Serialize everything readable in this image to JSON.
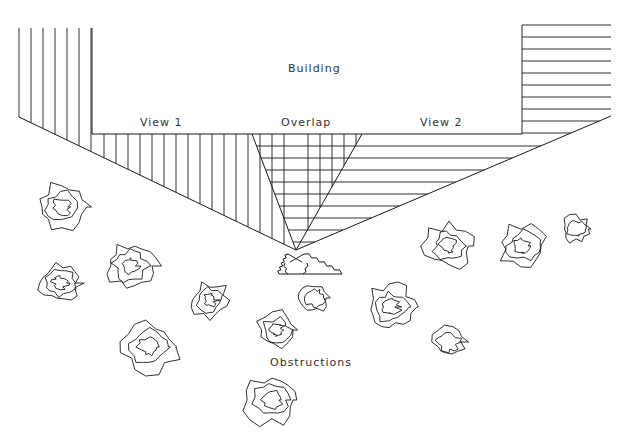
{
  "diagram": {
    "type": "camera-coverage-schematic",
    "labels": {
      "building": "Building",
      "view1": "View 1",
      "overlap": "Overlap",
      "view2": "View 2",
      "obstructions": "Obstructions"
    },
    "label_positions": {
      "building": {
        "x": 288,
        "y": 62
      },
      "view1": {
        "x": 140,
        "y": 116
      },
      "overlap": {
        "x": 281,
        "y": 116
      },
      "view2": {
        "x": 420,
        "y": 116
      },
      "obstructions": {
        "x": 270,
        "y": 356
      }
    },
    "colors": {
      "line": "#1a1a1a",
      "text": "#333333",
      "background": "#ffffff"
    },
    "geometry": {
      "camera_point": {
        "x": 296,
        "y": 250
      },
      "building_base_y": 134,
      "building_base_x1": 92,
      "building_base_x2": 522,
      "left_wall": {
        "x1": 19,
        "x2": 92,
        "top": 28,
        "slant_y_at_x1": 117
      },
      "right_wall": {
        "x1": 522,
        "x2": 611,
        "top": 25,
        "slant_y_at_x2": 116
      },
      "overlap_left_top_x": 252,
      "overlap_right_top_x": 362,
      "view1_hatch": "vertical",
      "view2_hatch": "horizontal",
      "overlap_hatch": "grid",
      "hatch_spacing": 12
    },
    "camera": {
      "name": "stereo camera pair",
      "base_y": 274,
      "x1": 279,
      "x2": 342
    },
    "obstructions": [
      {
        "cx": 62,
        "cy": 207,
        "r": 26
      },
      {
        "cx": 60,
        "cy": 283,
        "r": 22
      },
      {
        "cx": 131,
        "cy": 266,
        "r": 27
      },
      {
        "cx": 149,
        "cy": 347,
        "r": 30
      },
      {
        "cx": 210,
        "cy": 300,
        "r": 20
      },
      {
        "cx": 277,
        "cy": 330,
        "r": 21
      },
      {
        "cx": 315,
        "cy": 298,
        "r": 15
      },
      {
        "cx": 391,
        "cy": 307,
        "r": 25
      },
      {
        "cx": 449,
        "cy": 342,
        "r": 17
      },
      {
        "cx": 449,
        "cy": 246,
        "r": 25
      },
      {
        "cx": 523,
        "cy": 246,
        "r": 25
      },
      {
        "cx": 576,
        "cy": 229,
        "r": 15
      },
      {
        "cx": 272,
        "cy": 400,
        "r": 28
      }
    ]
  }
}
